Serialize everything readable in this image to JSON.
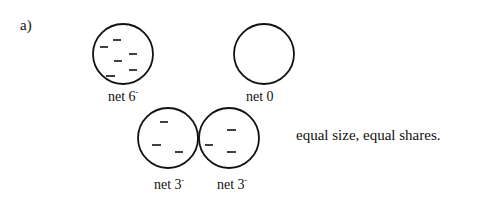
{
  "part_label": "a)",
  "diagram": {
    "top_left": {
      "label_prefix": "net 6",
      "label_sup": "-",
      "charges": 6
    },
    "top_right": {
      "label_prefix": "net 0",
      "label_sup": "",
      "charges": 0
    },
    "bottom_left": {
      "label_prefix": "net 3",
      "label_sup": "-",
      "charges": 3
    },
    "bottom_right": {
      "label_prefix": "net 3",
      "label_sup": "-",
      "charges": 3
    }
  },
  "caption": "equal size, equal shares."
}
